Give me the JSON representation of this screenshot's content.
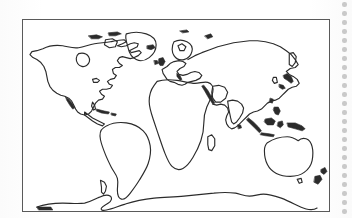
{
  "document": {
    "title": "World Outline Map",
    "kind": "blank-world-map",
    "caption": "",
    "scan_artifact": "dotted-perforation-strip-right-edge"
  },
  "map": {
    "name": "world-outline-map",
    "projection_label": "",
    "border_color": "#5a5a5a",
    "coastline_color": "#2b2b2b",
    "background_color": "#ffffff",
    "frame": {
      "x": 22,
      "y": 19,
      "width": 308,
      "height": 193
    },
    "graticule": "none",
    "labels": [],
    "landmasses": [
      {
        "name": "north-america"
      },
      {
        "name": "greenland"
      },
      {
        "name": "south-america"
      },
      {
        "name": "africa"
      },
      {
        "name": "europe"
      },
      {
        "name": "asia"
      },
      {
        "name": "australia"
      },
      {
        "name": "antarctica"
      },
      {
        "name": "madagascar"
      },
      {
        "name": "japan"
      },
      {
        "name": "new-zealand"
      },
      {
        "name": "british-isles"
      },
      {
        "name": "iceland"
      },
      {
        "name": "indonesia"
      },
      {
        "name": "philippines"
      },
      {
        "name": "new-guinea"
      },
      {
        "name": "cuba"
      },
      {
        "name": "sri-lanka"
      },
      {
        "name": "baja-california"
      },
      {
        "name": "kamchatka"
      },
      {
        "name": "tasmania"
      },
      {
        "name": "svalbard"
      }
    ]
  },
  "perforation": {
    "name": "binding-hole-strip",
    "dot_color": "#c9c9c9",
    "dot_count": 24,
    "dot_spacing": 9,
    "x": 345
  }
}
